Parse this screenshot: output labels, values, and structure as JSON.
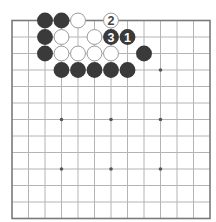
{
  "diagram": {
    "type": "go-board",
    "board_size": 13,
    "origin": {
      "x": 12,
      "y": 20.5
    },
    "spacing": 16.5,
    "colors": {
      "background": "#ffffff",
      "grid_line": "#b4b4b4",
      "border_line": "#7a7a7a",
      "black_stone": "#3a3a3a",
      "white_stone_fill": "#ffffff",
      "white_stone_stroke": "#9a9a9a",
      "star_point": "#555555",
      "label_on_black": "#ffffff",
      "label_on_white": "#444444"
    },
    "star_points": [
      {
        "col": 9,
        "row": 3
      },
      {
        "col": 3,
        "row": 6
      },
      {
        "col": 6,
        "row": 6
      },
      {
        "col": 9,
        "row": 6
      },
      {
        "col": 3,
        "row": 9
      },
      {
        "col": 6,
        "row": 9
      },
      {
        "col": 9,
        "row": 9
      }
    ],
    "stones": [
      {
        "color": "black",
        "col": 2,
        "row": 0,
        "label": ""
      },
      {
        "color": "black",
        "col": 3,
        "row": 0,
        "label": ""
      },
      {
        "color": "white",
        "col": 4,
        "row": 0,
        "label": ""
      },
      {
        "color": "white",
        "col": 6,
        "row": 0,
        "label": "2"
      },
      {
        "color": "black",
        "col": 2,
        "row": 1,
        "label": ""
      },
      {
        "color": "white",
        "col": 3,
        "row": 1,
        "label": ""
      },
      {
        "color": "white",
        "col": 5,
        "row": 1,
        "label": ""
      },
      {
        "color": "black",
        "col": 6,
        "row": 1,
        "label": "3"
      },
      {
        "color": "black",
        "col": 7,
        "row": 1,
        "label": "1"
      },
      {
        "color": "black",
        "col": 2,
        "row": 2,
        "label": ""
      },
      {
        "color": "white",
        "col": 3,
        "row": 2,
        "label": ""
      },
      {
        "color": "white",
        "col": 4,
        "row": 2,
        "label": ""
      },
      {
        "color": "white",
        "col": 5,
        "row": 2,
        "label": ""
      },
      {
        "color": "white",
        "col": 6,
        "row": 2,
        "label": ""
      },
      {
        "color": "black",
        "col": 8,
        "row": 2,
        "label": ""
      },
      {
        "color": "black",
        "col": 3,
        "row": 3,
        "label": ""
      },
      {
        "color": "black",
        "col": 4,
        "row": 3,
        "label": ""
      },
      {
        "color": "black",
        "col": 5,
        "row": 3,
        "label": ""
      },
      {
        "color": "black",
        "col": 6,
        "row": 3,
        "label": ""
      },
      {
        "color": "black",
        "col": 7,
        "row": 3,
        "label": ""
      }
    ]
  }
}
